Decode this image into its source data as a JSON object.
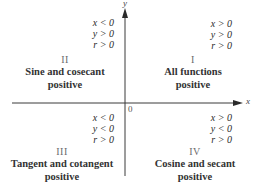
{
  "axes": {
    "x_label": "x",
    "y_label": "y",
    "origin_label": "0",
    "color": "#3a3a3a"
  },
  "quadrants": {
    "q1": {
      "numeral": "I",
      "conditions": [
        "x > 0",
        "y > 0",
        "r > 0"
      ],
      "line1": "All functions",
      "line2": "positive"
    },
    "q2": {
      "numeral": "II",
      "conditions": [
        "x < 0",
        "y > 0",
        "r > 0"
      ],
      "line1": "Sine and cosecant",
      "line2": "positive"
    },
    "q3": {
      "numeral": "III",
      "conditions": [
        "x < 0",
        "y < 0",
        "r > 0"
      ],
      "line1": "Tangent and cotangent",
      "line2": "positive"
    },
    "q4": {
      "numeral": "IV",
      "conditions": [
        "x > 0",
        "y < 0",
        "r > 0"
      ],
      "line1": "Cosine and secant",
      "line2": "positive"
    }
  }
}
